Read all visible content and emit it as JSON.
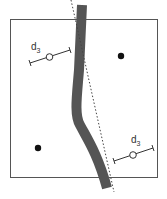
{
  "diagram": {
    "labels": {
      "left_measure": {
        "main": "d",
        "sub": "3"
      },
      "right_measure": {
        "main": "d",
        "sub": "3"
      }
    },
    "colors": {
      "band": "#555555",
      "frame": "#555555",
      "dotted_line": "#444444",
      "dot": "#111111",
      "background": "#ffffff"
    },
    "elements": {
      "frame": "rectangular border",
      "band": "thick gray curved band crossing vertically",
      "dotted_line": "straight dashed reference line",
      "points": [
        "filled dot upper right",
        "filled dot lower left"
      ],
      "measures": [
        "d3 interval bar left with open circle",
        "d3 interval bar right with open circle"
      ]
    }
  }
}
